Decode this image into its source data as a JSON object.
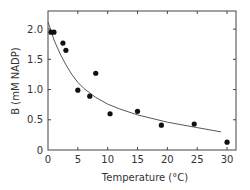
{
  "chart_data": {
    "type": "scatter",
    "title": "",
    "xlabel": "Temperature (°C)",
    "ylabel": "B (mM NADP)",
    "xlim": [
      0,
      31.5
    ],
    "ylim": [
      0,
      2.3
    ],
    "x_ticks": [
      0,
      5,
      10,
      15,
      20,
      25,
      30
    ],
    "y_ticks": [
      0,
      0.5,
      1.0,
      1.5,
      2.0
    ],
    "x_tick_labels": [
      "0",
      "5",
      "10",
      "15",
      "20",
      "25",
      "30"
    ],
    "y_tick_labels": [
      "0",
      "0.5",
      "1.0",
      "1.5",
      "2.0"
    ],
    "grid": false,
    "legend": null,
    "series": [
      {
        "name": "measured",
        "kind": "scatter",
        "x": [
          0.5,
          1.0,
          2.5,
          3.0,
          5.0,
          7.0,
          8.0,
          10.4,
          15.0,
          19.0,
          24.5,
          30.0
        ],
        "y": [
          1.95,
          1.95,
          1.77,
          1.65,
          0.99,
          0.89,
          1.27,
          0.6,
          0.64,
          0.41,
          0.43,
          0.13
        ]
      },
      {
        "name": "fitted curve",
        "kind": "line",
        "x": [
          0,
          1,
          2,
          3,
          4,
          5,
          6,
          8,
          10,
          12,
          15,
          20,
          25,
          29
        ],
        "y": [
          2.12,
          1.82,
          1.6,
          1.41,
          1.25,
          1.12,
          1.02,
          0.87,
          0.76,
          0.68,
          0.58,
          0.46,
          0.37,
          0.3
        ]
      }
    ]
  }
}
